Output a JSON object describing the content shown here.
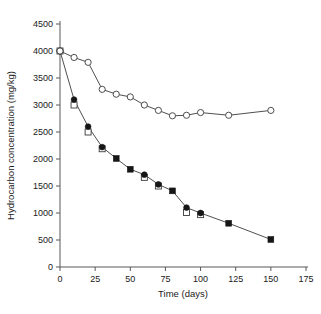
{
  "chart_data": {
    "type": "line",
    "title": "",
    "xlabel": "Time (days)",
    "ylabel": "Hydrocarbon concentration (mg/kg)",
    "xlim": [
      0,
      175
    ],
    "ylim": [
      0,
      4500
    ],
    "xticks": [
      0,
      25,
      50,
      75,
      100,
      125,
      150,
      175
    ],
    "yticks": [
      0,
      500,
      1000,
      1500,
      2000,
      2500,
      3000,
      3500,
      4000,
      4500
    ],
    "grid": false,
    "legend": "none",
    "series": [
      {
        "name": "open-circle-series",
        "marker": "open-circle",
        "x": [
          0,
          10,
          20,
          30,
          40,
          50,
          60,
          70,
          80,
          90,
          100,
          120,
          150
        ],
        "values": [
          4000,
          3880,
          3790,
          3290,
          3200,
          3150,
          3000,
          2900,
          2800,
          2810,
          2860,
          2810,
          2900
        ]
      },
      {
        "name": "filled-marker-series",
        "marker": "filled-circle-then-square",
        "x": [
          0,
          10,
          20,
          30,
          40,
          50,
          60,
          70,
          80,
          90,
          100,
          120,
          150
        ],
        "values": [
          4000,
          3100,
          2600,
          2220,
          2010,
          1810,
          1710,
          1530,
          1410,
          1100,
          1000,
          810,
          510
        ],
        "marker_types": [
          "open-circle",
          "filled-circle",
          "filled-circle",
          "filled-circle",
          "filled-square",
          "filled-square",
          "filled-circle",
          "filled-circle",
          "filled-square",
          "filled-circle",
          "filled-circle",
          "filled-square",
          "filled-square"
        ]
      },
      {
        "name": "open-square-series",
        "marker": "open-square",
        "x": [
          0,
          10,
          20,
          30,
          60,
          70,
          90,
          100
        ],
        "values": [
          4000,
          3000,
          2500,
          2190,
          1660,
          1500,
          1010,
          970
        ]
      }
    ]
  },
  "axis": {
    "x_title": "Time (days)",
    "y_title": "Hydrocarbon concentration (mg/kg)",
    "x_tick_labels": [
      "0",
      "25",
      "50",
      "75",
      "100",
      "125",
      "150",
      "175"
    ],
    "y_tick_labels": [
      "0",
      "500",
      "1000",
      "1500",
      "2000",
      "2500",
      "3000",
      "3500",
      "4000",
      "4500"
    ]
  },
  "colors": {
    "axis": "#58585a",
    "line": "#3b3b3b",
    "marker_fill": "#161616",
    "marker_open": "#ffffff",
    "background": "#ffffff"
  }
}
